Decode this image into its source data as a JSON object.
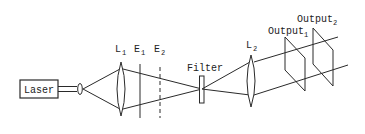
{
  "diagram": {
    "type": "optical-setup",
    "components": {
      "laser": {
        "label": "Laser"
      },
      "lens1": {
        "label": "L",
        "subscript": "1"
      },
      "plane_e1": {
        "label": "E",
        "subscript": "1",
        "style": "solid"
      },
      "plane_e2": {
        "label": "E",
        "subscript": "2",
        "style": "dashed"
      },
      "filter": {
        "label": "Filter"
      },
      "lens2": {
        "label": "L",
        "subscript": "2"
      },
      "output1": {
        "label": "Output",
        "subscript": "1"
      },
      "output2": {
        "label": "Output",
        "subscript": "2"
      }
    },
    "colors": {
      "stroke": "#2a2a2a",
      "background": "#ffffff"
    }
  }
}
